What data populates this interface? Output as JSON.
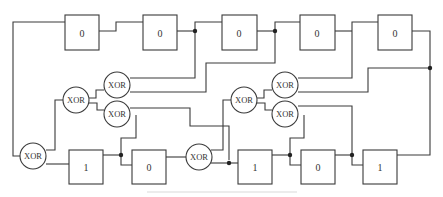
{
  "diagram": {
    "type": "shift-register / linear feedback circuit",
    "top_row_registers": [
      {
        "id": "r1",
        "value": "0"
      },
      {
        "id": "r2",
        "value": "0"
      },
      {
        "id": "r3",
        "value": "0"
      },
      {
        "id": "r4",
        "value": "0"
      },
      {
        "id": "r5",
        "value": "0"
      }
    ],
    "bottom_row_registers": [
      {
        "id": "r6",
        "value": "1"
      },
      {
        "id": "r7",
        "value": "0"
      },
      {
        "id": "r8",
        "value": "1"
      },
      {
        "id": "r9",
        "value": "0"
      },
      {
        "id": "r10",
        "value": "1"
      }
    ],
    "xor_gates": [
      {
        "id": "x1",
        "label": "XOR"
      },
      {
        "id": "x2",
        "label": "XOR"
      },
      {
        "id": "x3",
        "label": "XOR"
      },
      {
        "id": "x4",
        "label": "XOR"
      },
      {
        "id": "x5",
        "label": "XOR"
      },
      {
        "id": "x6",
        "label": "XOR"
      },
      {
        "id": "x7",
        "label": "XOR"
      },
      {
        "id": "x8",
        "label": "XOR"
      }
    ],
    "colors": {
      "line": "#3a3a3a",
      "junction": "#222222",
      "background": "#ffffff"
    }
  }
}
